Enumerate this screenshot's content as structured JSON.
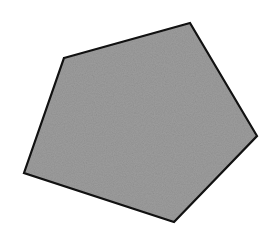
{
  "diagram": {
    "shape": "pentagon",
    "vertices": [
      [
        64,
        58
      ],
      [
        190,
        23
      ],
      [
        257,
        136
      ],
      [
        174,
        222
      ],
      [
        24,
        173
      ]
    ],
    "fill_color": "#9d9d9d",
    "stroke_color": "#111111",
    "stroke_width": 2.2,
    "background_color": "#ffffff",
    "texture": "noise"
  }
}
